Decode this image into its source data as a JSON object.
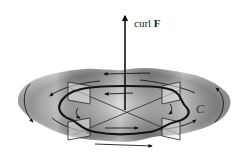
{
  "figure": {
    "labels": {
      "axis_vector": "curl F",
      "axis_vector_prefix": "curl ",
      "axis_vector_symbol": "F",
      "curve": "C"
    },
    "colors": {
      "surface_dark": "#6e6e6e",
      "surface_light": "#d8d8d8",
      "lines": "#1a1a1a",
      "background": "#ffffff"
    },
    "elements": {
      "surface": "wavy shaded disc in perspective",
      "axis_arrow": "vertical arrow from center upward",
      "closed_curve": "thick wavy loop C around axis",
      "paddle_wheel": "two crossing blades with triangular paddles at four ends",
      "flow_arrows": "circulating arrows indicating counterclockwise rotation"
    }
  }
}
